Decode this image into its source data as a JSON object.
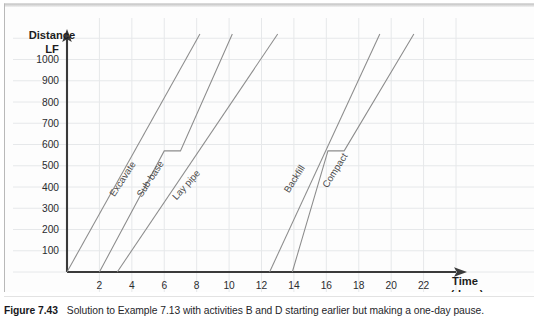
{
  "figure": {
    "label": "Figure 7.43",
    "caption": "Solution to Example 7.13 with activities B and D starting earlier but making a one-day pause."
  },
  "colors": {
    "grid": "#e6e8ea",
    "axis": "#3a3a3a",
    "line": "#8c8c8c",
    "text": "#1d1d21",
    "panel_background": "#fdfdfd"
  },
  "chart_data": {
    "type": "line",
    "title": "",
    "subtitle": "",
    "xlabel": "Time",
    "xlabel_unit": "(days)",
    "ylabel": "Distance",
    "ylabel_unit": "LF",
    "xlim": [
      0,
      24
    ],
    "ylim": [
      0,
      1120
    ],
    "grid": true,
    "grid_x_step": 2,
    "grid_y_step": 100,
    "legend": "inline-rotated-labels",
    "xticks": [
      2,
      4,
      6,
      8,
      10,
      12,
      14,
      16,
      18,
      20,
      22
    ],
    "xticklabels": [
      "2",
      "4",
      "6",
      "8",
      "10",
      "12",
      "14",
      "16",
      "18",
      "20",
      "22"
    ],
    "yticks": [
      100,
      200,
      300,
      400,
      500,
      600,
      700,
      800,
      900,
      1000
    ],
    "yticklabels": [
      "100",
      "200",
      "300",
      "400",
      "500",
      "600",
      "700",
      "800",
      "900",
      "1000"
    ],
    "series": [
      {
        "name": "Excavate",
        "label": "Excavate",
        "points": [
          [
            0,
            0
          ],
          [
            8.2,
            1120
          ]
        ],
        "label_pos": [
          3.6,
          430
        ],
        "label_rotation": -57
      },
      {
        "name": "Sub-base",
        "label": "Sub-base",
        "points": [
          [
            2.0,
            0
          ],
          [
            6.0,
            570
          ],
          [
            7.0,
            570
          ],
          [
            10.2,
            1120
          ]
        ],
        "label_pos": [
          5.3,
          430
        ],
        "label_rotation": -57
      },
      {
        "name": "Lay pipe",
        "label": "Lay pipe",
        "points": [
          [
            3.1,
            0
          ],
          [
            13.0,
            1120
          ]
        ],
        "label_pos": [
          7.5,
          400
        ],
        "label_rotation": -48
      },
      {
        "name": "Backfill",
        "label": "Backfill",
        "points": [
          [
            12.5,
            0
          ],
          [
            19.3,
            1120
          ]
        ],
        "label_pos": [
          14.2,
          430
        ],
        "label_rotation": -58
      },
      {
        "name": "Compact",
        "label": "Compact",
        "points": [
          [
            13.9,
            0
          ],
          [
            16.1,
            570
          ],
          [
            17.1,
            570
          ],
          [
            21.4,
            1120
          ]
        ],
        "label_pos": [
          16.7,
          470
        ],
        "label_rotation": -58
      }
    ]
  }
}
